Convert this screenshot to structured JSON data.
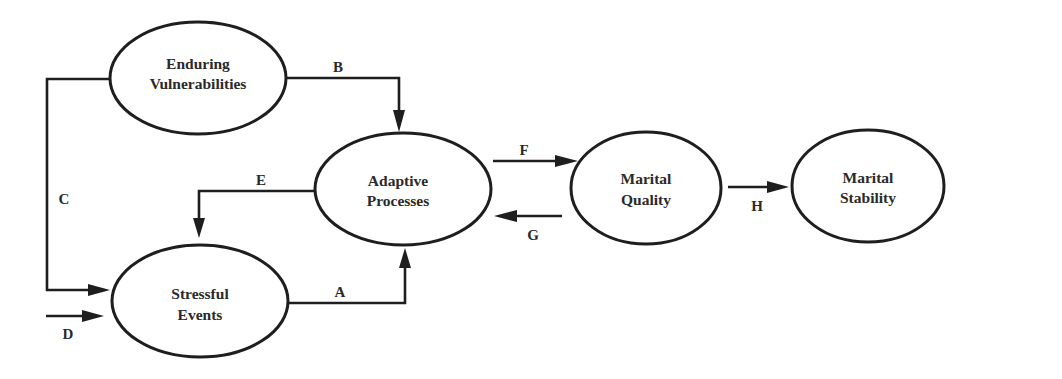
{
  "diagram": {
    "type": "flow-diagram",
    "colors": {
      "stroke": "#1e1e1e",
      "text": "#2a2a2a",
      "background": "#ffffff"
    },
    "nodes": [
      {
        "id": "enduring_vulnerabilities",
        "line1": "Enduring",
        "line2": "Vulnerabilities"
      },
      {
        "id": "adaptive_processes",
        "line1": "Adaptive",
        "line2": "Processes"
      },
      {
        "id": "stressful_events",
        "line1": "Stressful",
        "line2": "Events"
      },
      {
        "id": "marital_quality",
        "line1": "Marital",
        "line2": "Quality"
      },
      {
        "id": "marital_stability",
        "line1": "Marital",
        "line2": "Stability"
      }
    ],
    "edges": [
      {
        "label": "A",
        "from": "stressful_events",
        "to": "adaptive_processes"
      },
      {
        "label": "B",
        "from": "enduring_vulnerabilities",
        "to": "adaptive_processes"
      },
      {
        "label": "C",
        "from": "enduring_vulnerabilities",
        "to": "stressful_events"
      },
      {
        "label": "D",
        "from": "external",
        "to": "stressful_events"
      },
      {
        "label": "E",
        "from": "adaptive_processes",
        "to": "stressful_events"
      },
      {
        "label": "F",
        "from": "adaptive_processes",
        "to": "marital_quality"
      },
      {
        "label": "G",
        "from": "marital_quality",
        "to": "adaptive_processes"
      },
      {
        "label": "H",
        "from": "marital_quality",
        "to": "marital_stability"
      }
    ]
  }
}
